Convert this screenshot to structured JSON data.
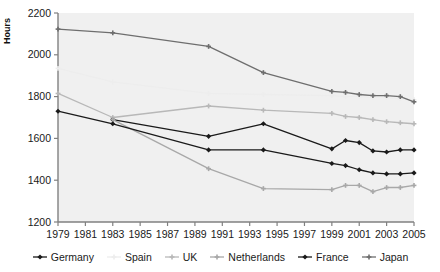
{
  "chart_data": {
    "type": "line",
    "title": "",
    "xlabel": "",
    "ylabel": "Hours",
    "ylim": [
      1200,
      2200
    ],
    "ytick_values": [
      1200,
      1400,
      1600,
      1800,
      2000,
      2200
    ],
    "ytick_labels": [
      "1200",
      "1400",
      "1600",
      "1800",
      "2000",
      "2200"
    ],
    "xlim": [
      1979,
      2005
    ],
    "xtick_values": [
      1979,
      1981,
      1983,
      1985,
      1987,
      1989,
      1991,
      1993,
      1995,
      1997,
      1999,
      2001,
      2003,
      2005
    ],
    "xtick_labels": [
      "1979",
      "1981",
      "1983",
      "1985",
      "1987",
      "1989",
      "1991",
      "1993",
      "1995",
      "1997",
      "1999",
      "2001",
      "2003",
      "2005"
    ],
    "grid": false,
    "legend_position": "bottom",
    "plot_background": "#f0f0f0",
    "series": [
      {
        "name": "Germany",
        "color": "#1a1a1a",
        "marker": "diamond",
        "x": [
          1983,
          1990,
          1994,
          1999,
          2000,
          2001,
          2002,
          2003,
          2004,
          2005
        ],
        "y": [
          1690,
          1610,
          1670,
          1550,
          1590,
          1580,
          1540,
          1535,
          1545,
          1545
        ]
      },
      {
        "name": "Spain",
        "color": "#ededed",
        "marker": "plus",
        "x": [
          1979,
          1983,
          1990,
          1994,
          1999,
          2000,
          2001,
          2002,
          2003,
          2004,
          2005
        ],
        "y": [
          1935,
          1870,
          1815,
          1810,
          1805,
          1800,
          1800,
          1795,
          1795,
          1790,
          1785
        ]
      },
      {
        "name": "UK",
        "color": "#b8b8b8",
        "marker": "plus",
        "x": [
          1979,
          1983,
          1990,
          1994,
          1999,
          2000,
          2001,
          2002,
          2003,
          2004,
          2005
        ],
        "y": [
          1815,
          1700,
          1755,
          1735,
          1720,
          1705,
          1700,
          1690,
          1680,
          1675,
          1670
        ]
      },
      {
        "name": "Netherlands",
        "color": "#a8a8a8",
        "marker": "plus",
        "x": [
          1983,
          1990,
          1994,
          1999,
          2000,
          2001,
          2002,
          2003,
          2004,
          2005
        ],
        "y": [
          1690,
          1455,
          1360,
          1355,
          1375,
          1375,
          1345,
          1365,
          1365,
          1375
        ]
      },
      {
        "name": "France",
        "color": "#1a1a1a",
        "marker": "diamond",
        "x": [
          1979,
          1983,
          1990,
          1994,
          1999,
          2000,
          2001,
          2002,
          2003,
          2004,
          2005
        ],
        "y": [
          1730,
          1670,
          1545,
          1545,
          1480,
          1470,
          1450,
          1435,
          1430,
          1430,
          1435
        ]
      },
      {
        "name": "Japan",
        "color": "#6e6e6e",
        "marker": "plus",
        "x": [
          1979,
          1983,
          1990,
          1994,
          1999,
          2000,
          2001,
          2002,
          2003,
          2004,
          2005
        ],
        "y": [
          2123,
          2105,
          2040,
          1915,
          1825,
          1820,
          1810,
          1805,
          1805,
          1800,
          1775
        ]
      }
    ]
  },
  "legend": {
    "items": [
      {
        "label": "Germany"
      },
      {
        "label": "Spain"
      },
      {
        "label": "UK"
      },
      {
        "label": "Netherlands"
      },
      {
        "label": "France"
      },
      {
        "label": "Japan"
      }
    ]
  }
}
